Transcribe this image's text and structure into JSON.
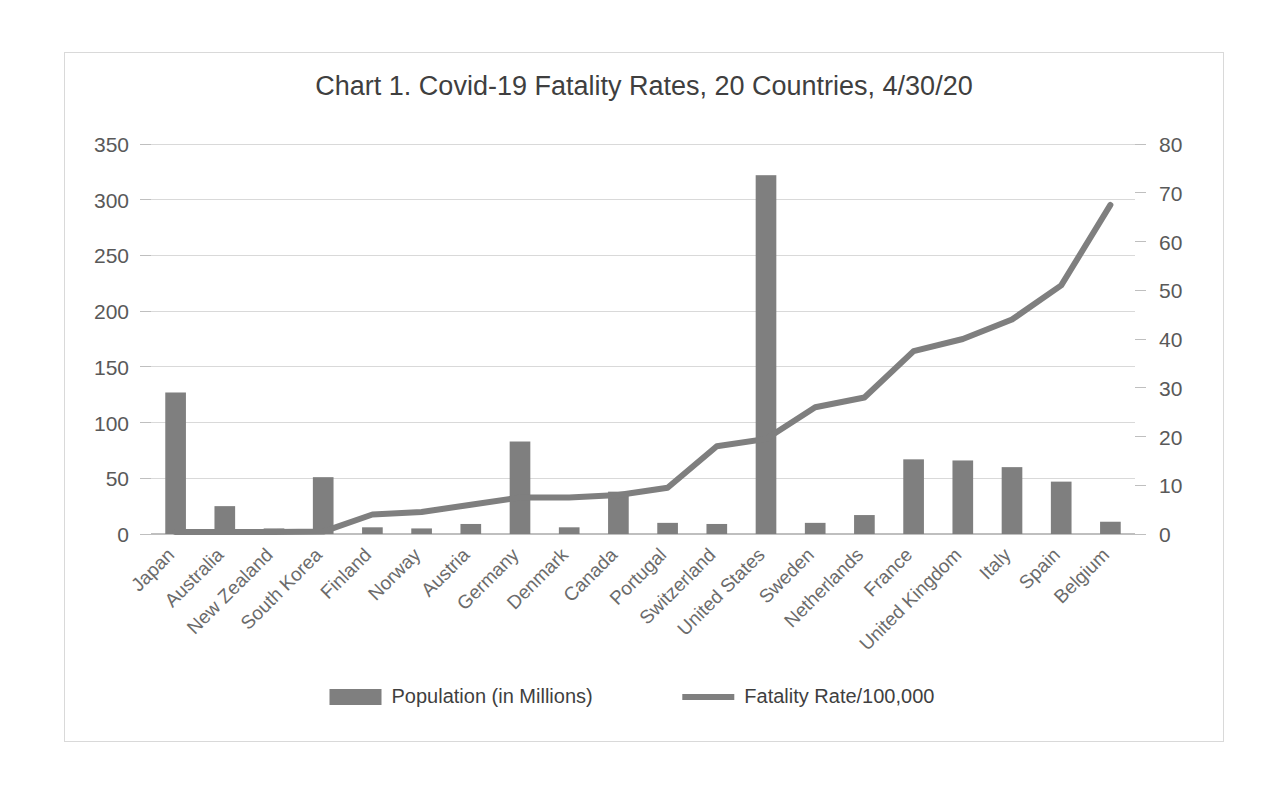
{
  "chart_data": {
    "type": "bar",
    "title": "Chart 1. Covid-19 Fatality Rates, 20 Countries, 4/30/20",
    "xlabel": "",
    "ylabel": "",
    "grid": true,
    "legend_position": "bottom",
    "categories": [
      "Japan",
      "Australia",
      "New Zealand",
      "South Korea",
      "Finland",
      "Norway",
      "Austria",
      "Germany",
      "Denmark",
      "Canada",
      "Portugal",
      "Switzerland",
      "United States",
      "Sweden",
      "Netherlands",
      "France",
      "United Kingdom",
      "Italy",
      "Spain",
      "Belgium"
    ],
    "series": [
      {
        "name": "Population (in Millions)",
        "type": "bar",
        "axis": "left",
        "color": "#7f7f7f",
        "values": [
          127,
          25,
          5,
          51,
          6,
          5,
          9,
          83,
          6,
          38,
          10,
          9,
          322,
          10,
          17,
          67,
          66,
          60,
          47,
          11
        ]
      },
      {
        "name": "Fatality Rate/100,000",
        "type": "line",
        "axis": "right",
        "color": "#7f7f7f",
        "values": [
          0.4,
          0.4,
          0.4,
          0.5,
          4,
          4.5,
          6,
          7.5,
          7.5,
          8,
          9.5,
          18,
          19.5,
          26,
          28,
          37.5,
          40,
          44,
          51,
          67.5
        ]
      }
    ],
    "left_axis": {
      "min": 0,
      "max": 350,
      "step": 50,
      "ticks": [
        "0",
        "50",
        "100",
        "150",
        "200",
        "250",
        "300",
        "350"
      ]
    },
    "right_axis": {
      "min": 0,
      "max": 80,
      "step": 10,
      "ticks": [
        "0",
        "10",
        "20",
        "30",
        "40",
        "50",
        "60",
        "70",
        "80"
      ]
    },
    "legend": [
      {
        "label": "Population (in Millions)",
        "marker": "bar",
        "color": "#7f7f7f"
      },
      {
        "label": "Fatality Rate/100,000",
        "marker": "line",
        "color": "#7f7f7f"
      }
    ]
  }
}
